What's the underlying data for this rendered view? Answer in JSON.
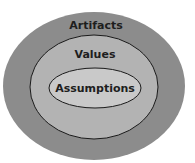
{
  "diagram": {
    "type": "nested-ellipses",
    "layers": [
      {
        "label": "Artifacts",
        "color": "#8c8c8c"
      },
      {
        "label": "Values",
        "color": "#b3b3b3"
      },
      {
        "label": "Assumptions",
        "color": "#c9c9c9"
      }
    ]
  }
}
